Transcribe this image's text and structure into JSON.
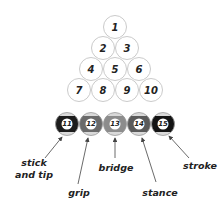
{
  "diagram": {
    "title": "",
    "balls": [
      {
        "num": "1",
        "row": 1,
        "cx": 115,
        "cy": 27,
        "type": "solid"
      },
      {
        "num": "2",
        "row": 2,
        "cx": 103,
        "cy": 48,
        "type": "solid"
      },
      {
        "num": "3",
        "row": 2,
        "cx": 127,
        "cy": 48,
        "type": "solid"
      },
      {
        "num": "4",
        "row": 3,
        "cx": 91,
        "cy": 69,
        "type": "solid"
      },
      {
        "num": "5",
        "row": 3,
        "cx": 115,
        "cy": 69,
        "type": "solid"
      },
      {
        "num": "6",
        "row": 3,
        "cx": 139,
        "cy": 69,
        "type": "solid"
      },
      {
        "num": "7",
        "row": 4,
        "cx": 79,
        "cy": 90,
        "type": "solid"
      },
      {
        "num": "8",
        "row": 4,
        "cx": 103,
        "cy": 90,
        "type": "solid"
      },
      {
        "num": "9",
        "row": 4,
        "cx": 127,
        "cy": 90,
        "type": "solid"
      },
      {
        "num": "10",
        "row": 4,
        "cx": 151,
        "cy": 90,
        "type": "solid"
      },
      {
        "num": "11",
        "row": 5,
        "cx": 67,
        "cy": 124,
        "type": "stripe",
        "band": "#1c1c1c"
      },
      {
        "num": "12",
        "row": 5,
        "cx": 91,
        "cy": 124,
        "type": "stripe",
        "band": "#6a6a6a"
      },
      {
        "num": "13",
        "row": 5,
        "cx": 115,
        "cy": 124,
        "type": "stripe",
        "band": "#8c8c8c"
      },
      {
        "num": "14",
        "row": 5,
        "cx": 139,
        "cy": 124,
        "type": "stripe",
        "band": "#5a5a5a"
      },
      {
        "num": "15",
        "row": 5,
        "cx": 163,
        "cy": 124,
        "type": "stripe",
        "band": "#141414"
      }
    ],
    "labels": [
      {
        "key": "stick_and_tip",
        "line1": "stick",
        "line2": "and tip",
        "ball": "11"
      },
      {
        "key": "grip",
        "line1": "grip",
        "ball": "12"
      },
      {
        "key": "bridge",
        "line1": "bridge",
        "ball": "13"
      },
      {
        "key": "stance",
        "line1": "stance",
        "ball": "14"
      },
      {
        "key": "stroke",
        "line1": "stroke",
        "ball": "15"
      }
    ],
    "colors": {
      "ball_outline": "#bdbdbd",
      "cap": "#d9d9d9",
      "text": "#222222",
      "arrow": "#444444"
    }
  }
}
